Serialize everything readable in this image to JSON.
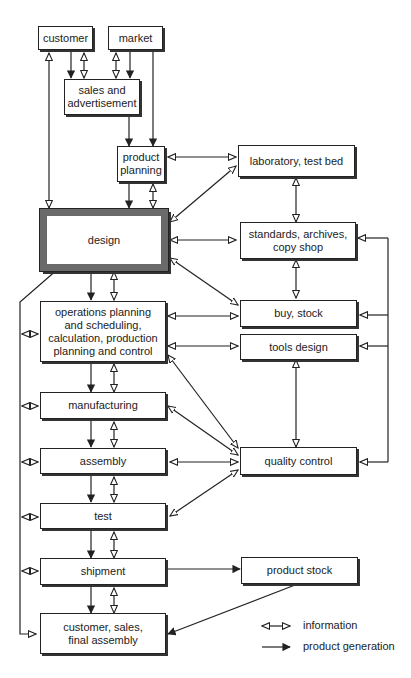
{
  "diagram": {
    "nodes": {
      "customer": "customer",
      "market": "market",
      "sales": "sales and\nadvertisement",
      "product_planning": "product\nplanning",
      "laboratory": "laboratory, test bed",
      "design": "design",
      "standards": "standards, archives,\ncopy shop",
      "operations": "operations planning\nand scheduling,\ncalculation, production\nplanning and control",
      "buy_stock": "buy, stock",
      "tools_design": "tools design",
      "manufacturing": "manufacturing",
      "assembly": "assembly",
      "quality_control": "quality control",
      "test": "test",
      "shipment": "shipment",
      "product_stock": "product stock",
      "final": "customer, sales,\nfinal assembly"
    },
    "legend": {
      "information": "information",
      "product_generation": "product generation"
    },
    "colors": {
      "line": "#222222",
      "design_border": "#6a6a6a"
    }
  }
}
